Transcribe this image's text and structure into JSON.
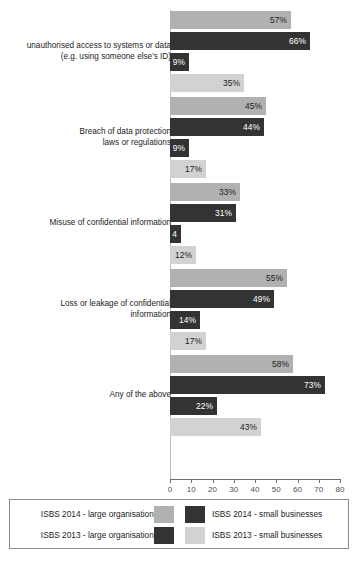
{
  "chart_data": {
    "type": "bar",
    "orientation": "horizontal",
    "title": "",
    "xlabel": "",
    "ylabel": "",
    "xlim": [
      0,
      80
    ],
    "xticks": [
      0,
      10,
      20,
      30,
      40,
      50,
      60,
      70,
      80
    ],
    "grid": false,
    "legend_position": "bottom",
    "categories": [
      "unauthorised access to systems or data\n(e.g. using someone else's ID)",
      "Breach of data protection\nlaws or regulations",
      "Misuse of confidential information",
      "Loss or leakage of confidential\ninformation",
      "Any of the above"
    ],
    "series": [
      {
        "name": "ISBS 2014 - large organisations",
        "color": "#b1b1b1",
        "values": [
          57,
          45,
          33,
          55,
          58
        ],
        "labels": [
          "57%",
          "45%",
          "33%",
          "55%",
          "58%"
        ]
      },
      {
        "name": "ISBS 2014 - small businesses",
        "color": "#333333",
        "values": [
          66,
          44,
          31,
          49,
          73
        ],
        "labels": [
          "66%",
          "44%",
          "31%",
          "49%",
          "73%"
        ]
      },
      {
        "name": "ISBS 2013 - large organisations",
        "color": "#333333",
        "values": [
          9,
          9,
          4,
          14,
          22
        ],
        "labels": [
          "9%",
          "9%",
          "4",
          "14%",
          "22%"
        ]
      },
      {
        "name": "ISBS 2013 - small businesses",
        "color": "#d2d2d2",
        "values": [
          35,
          17,
          12,
          17,
          43
        ],
        "labels": [
          "35%",
          "17%",
          "12%",
          "17%",
          "43%"
        ]
      }
    ]
  },
  "axis": {
    "tick_labels": [
      "0",
      "10",
      "20",
      "30",
      "40",
      "50",
      "60",
      "70",
      "80"
    ]
  },
  "groups": [
    {
      "label": "unauthorised access to systems or data\n(e.g. using someone else's ID)",
      "bars": [
        {
          "series": "ISBS 2014 - large organisations",
          "value": 57,
          "label": "57%"
        },
        {
          "series": "ISBS 2014 - small businesses",
          "value": 66,
          "label": "66%"
        },
        {
          "series": "ISBS 2013 - large organisations",
          "value": 9,
          "label": "9%"
        },
        {
          "series": "ISBS 2013 - small businesses",
          "value": 35,
          "label": "35%"
        }
      ]
    },
    {
      "label": "Breach of data protection\nlaws or regulations",
      "bars": [
        {
          "series": "ISBS 2014 - large organisations",
          "value": 45,
          "label": "45%"
        },
        {
          "series": "ISBS 2014 - small businesses",
          "value": 44,
          "label": "44%"
        },
        {
          "series": "ISBS 2013 - large organisations",
          "value": 9,
          "label": "9%"
        },
        {
          "series": "ISBS 2013 - small businesses",
          "value": 17,
          "label": "17%"
        }
      ]
    },
    {
      "label": "Misuse of confidential information",
      "bars": [
        {
          "series": "ISBS 2014 - large organisations",
          "value": 33,
          "label": "33%"
        },
        {
          "series": "ISBS 2014 - small businesses",
          "value": 31,
          "label": "31%"
        },
        {
          "series": "ISBS 2013 - large organisations",
          "value": 4,
          "label": "4"
        },
        {
          "series": "ISBS 2013 - small businesses",
          "value": 12,
          "label": "12%"
        }
      ]
    },
    {
      "label": "Loss or leakage of confidential\ninformation",
      "bars": [
        {
          "series": "ISBS 2014 - large organisations",
          "value": 55,
          "label": "55%"
        },
        {
          "series": "ISBS 2014 - small businesses",
          "value": 49,
          "label": "49%"
        },
        {
          "series": "ISBS 2013 - large organisations",
          "value": 14,
          "label": "14%"
        },
        {
          "series": "ISBS 2013 - small businesses",
          "value": 17,
          "label": "17%"
        }
      ]
    },
    {
      "label": "Any of the above",
      "bars": [
        {
          "series": "ISBS 2014 - large organisations",
          "value": 58,
          "label": "58%"
        },
        {
          "series": "ISBS 2014 - small businesses",
          "value": 73,
          "label": "73%"
        },
        {
          "series": "ISBS 2013 - large organisations",
          "value": 22,
          "label": "22%"
        },
        {
          "series": "ISBS 2013 - small businesses",
          "value": 43,
          "label": "43%"
        }
      ]
    }
  ],
  "legend": {
    "rows": [
      {
        "left_label": "ISBS 2014 - large organisations",
        "left_color": "#b1b1b1",
        "right_label": "ISBS 2014 - small businesses",
        "right_color": "#333333"
      },
      {
        "left_label": "ISBS 2013 - large organisations",
        "left_color": "#333333",
        "right_label": "ISBS 2013 - small businesses",
        "right_color": "#d2d2d2"
      }
    ]
  }
}
